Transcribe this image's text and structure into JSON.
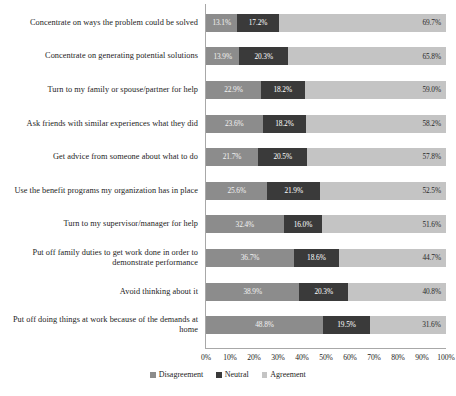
{
  "chart_data": {
    "type": "bar",
    "subtype": "stacked-horizontal-bar-100",
    "title": "",
    "xlabel": "",
    "ylabel": "",
    "xlim": [
      0,
      100
    ],
    "xtick_labels": [
      "0%",
      "10%",
      "20%",
      "30%",
      "40%",
      "50%",
      "60%",
      "70%",
      "80%",
      "90%",
      "100%"
    ],
    "xticks": [
      0,
      10,
      20,
      30,
      40,
      50,
      60,
      70,
      80,
      90,
      100
    ],
    "grid": false,
    "legend_position": "bottom-center",
    "categories": [
      "Concentrate on ways the problem could be solved",
      "Concentrate on generating potential solutions",
      "Turn to my family or spouse/partner for help",
      "Ask friends with similar experiences what they did",
      "Get advice from someone about what to do",
      "Use the benefit programs my organization has in place",
      "Turn to my supervisor/manager for help",
      "Put off family duties to get work done in order to demonstrate performance",
      "Avoid thinking about it",
      "Put off doing things at work because of the demands at home"
    ],
    "series": [
      {
        "name": "Disagreement",
        "color": "#8c8c8c",
        "values": [
          13.1,
          13.9,
          22.9,
          23.6,
          21.7,
          25.6,
          32.4,
          36.7,
          38.9,
          48.8
        ],
        "labels": [
          "13.1%",
          "13.9%",
          "22.9%",
          "23.6%",
          "21.7%",
          "25.6%",
          "32.4%",
          "36.7%",
          "38.9%",
          "48.8%"
        ]
      },
      {
        "name": "Neutral",
        "color": "#3a3a3a",
        "values": [
          17.2,
          20.3,
          18.2,
          18.2,
          20.5,
          21.9,
          16.0,
          18.6,
          20.3,
          19.5
        ],
        "labels": [
          "17.2%",
          "20.3%",
          "18.2%",
          "18.2%",
          "20.5%",
          "21.9%",
          "16.0%",
          "18.6%",
          "20.3%",
          "19.5%"
        ]
      },
      {
        "name": "Agreement",
        "color": "#c4c4c4",
        "values": [
          69.7,
          65.8,
          59.0,
          58.2,
          57.8,
          52.5,
          51.6,
          44.7,
          40.8,
          31.6
        ],
        "labels": [
          "69.7%",
          "65.8%",
          "59.0%",
          "58.2%",
          "57.8%",
          "52.5%",
          "51.6%",
          "44.7%",
          "40.8%",
          "31.6%"
        ]
      }
    ],
    "legend": [
      "Disagreement",
      "Neutral",
      "Agreement"
    ]
  }
}
